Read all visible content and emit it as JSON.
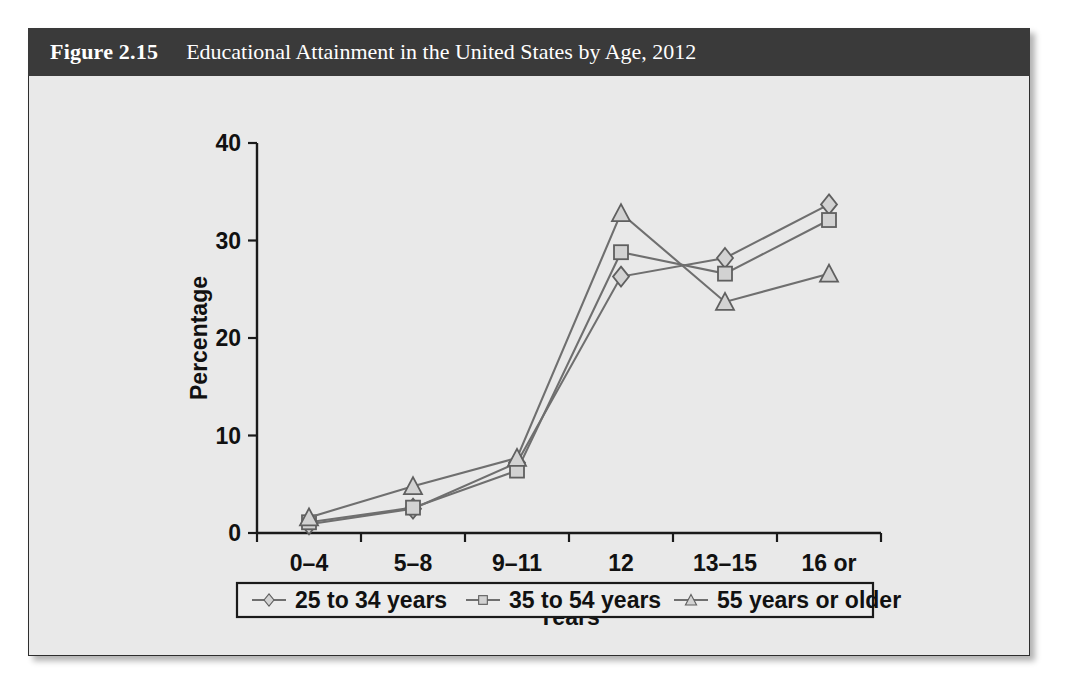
{
  "figure": {
    "number": "Figure 2.15",
    "title": "Educational Attainment in the United States by Age, 2012"
  },
  "colors": {
    "header_bar": "#3a3a3a",
    "figure_background": "#e9e9e9",
    "line": "#6f6f6f",
    "marker_fill": "#d2d2d2",
    "axis": "#1a1a1a"
  },
  "chart_data": {
    "type": "line",
    "title": "Educational Attainment in the United States by Age, 2012",
    "xlabel": "Years",
    "ylabel": "Percentage",
    "categories": [
      "0–4",
      "5–8",
      "9–11",
      "12",
      "13–15",
      "16 or\nmore"
    ],
    "category_labels_line1": [
      "0–4",
      "5–8",
      "9–11",
      "12",
      "13–15",
      "16 or"
    ],
    "category_labels_line2": [
      "",
      "",
      "",
      "",
      "",
      "more"
    ],
    "ylim": [
      0,
      40
    ],
    "yticks": [
      0,
      10,
      20,
      30,
      40
    ],
    "ytick_labels": [
      "0",
      "10",
      "20",
      "30",
      "40"
    ],
    "grid": false,
    "legend_position": "bottom",
    "series": [
      {
        "name": "25 to 34 years",
        "marker": "diamond",
        "values": [
          0.9,
          2.5,
          7.2,
          26.3,
          28.2,
          33.7
        ]
      },
      {
        "name": "35 to 54 years",
        "marker": "square",
        "values": [
          1.1,
          2.6,
          6.4,
          28.8,
          26.6,
          32.1
        ]
      },
      {
        "name": "55 years or older",
        "marker": "triangle",
        "values": [
          1.6,
          4.8,
          7.7,
          32.8,
          23.7,
          26.6
        ]
      }
    ]
  }
}
